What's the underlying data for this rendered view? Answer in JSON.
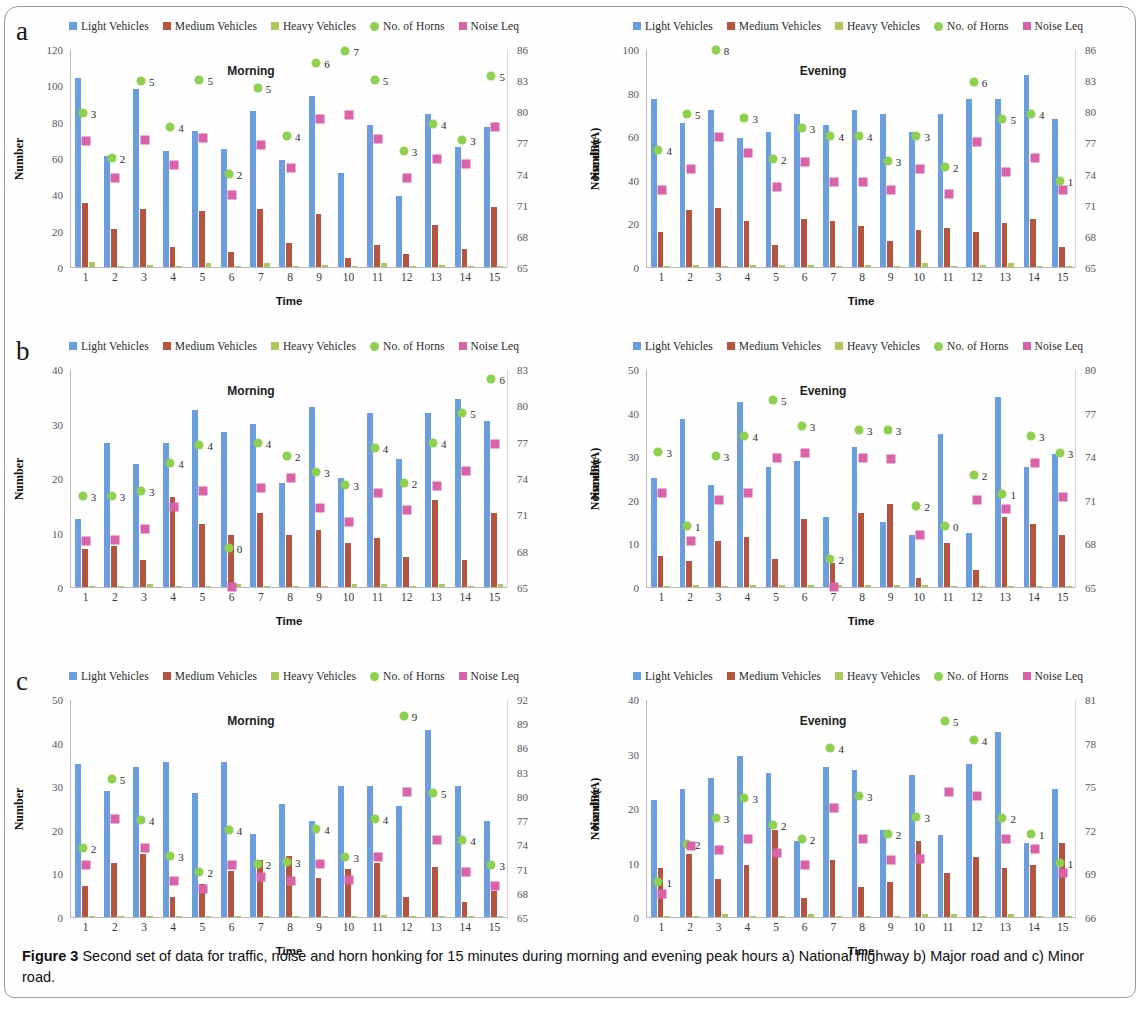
{
  "figure": {
    "caption_label": "Figure 3",
    "caption_text": " Second set of data for traffic, noise and horn honking for 15 minutes during morning and evening peak hours a) National highway b) Major road and c) Minor road."
  },
  "panels": [
    {
      "letter": "a",
      "road": "National highway"
    },
    {
      "letter": "b",
      "road": "Major road"
    },
    {
      "letter": "c",
      "road": "Minor road"
    }
  ],
  "legend": [
    {
      "label": "Light Vehicles",
      "color": "#6a9ede",
      "shape": "square",
      "icon": "light-vehicles-swatch"
    },
    {
      "label": "Medium Vehicles",
      "color": "#b5553f",
      "shape": "square",
      "icon": "medium-vehicles-swatch"
    },
    {
      "label": "Heavy Vehicles",
      "color": "#adc85a",
      "shape": "square",
      "icon": "heavy-vehicles-swatch"
    },
    {
      "label": "No. of Horns",
      "color": "#8fd14f",
      "shape": "dot",
      "icon": "no-of-horns-swatch"
    },
    {
      "label": "Noise Leq",
      "color": "#d963a8",
      "shape": "square",
      "icon": "noise-leq-swatch"
    }
  ],
  "axis_labels": {
    "x": "Time",
    "y_left": "Number",
    "y_right": "Noise dB(A)"
  },
  "colors": {
    "light_vehicles": "#6a9ede",
    "medium_vehicles": "#b5553f",
    "heavy_vehicles": "#adc85a",
    "horns": "#8fd14f",
    "noise": "#d963a8"
  },
  "chart_data": [
    {
      "id": "a-morning",
      "type": "bar",
      "title": "Morning",
      "panel": "a",
      "road": "National highway",
      "xlabel": "Time",
      "ylabel": "Number",
      "y2label": "Noise dB(A)",
      "categories": [
        "1",
        "2",
        "3",
        "4",
        "5",
        "6",
        "7",
        "8",
        "9",
        "10",
        "11",
        "12",
        "13",
        "14",
        "15"
      ],
      "ylim": [
        0,
        120
      ],
      "yticks": [
        0,
        20,
        40,
        60,
        80,
        100,
        120
      ],
      "y2lim": [
        65,
        86
      ],
      "y2ticks": [
        65,
        68,
        71,
        74,
        77,
        80,
        83,
        86
      ],
      "series": [
        {
          "name": "Light Vehicles",
          "values": [
            104,
            61,
            98,
            64,
            75,
            65,
            86,
            59,
            94,
            52,
            78,
            39,
            84,
            66,
            77
          ]
        },
        {
          "name": "Medium Vehicles",
          "values": [
            35,
            21,
            32,
            11,
            31,
            8,
            32,
            13,
            29,
            5,
            12,
            7,
            23,
            10,
            33
          ]
        },
        {
          "name": "Heavy Vehicles",
          "values": [
            3,
            0,
            1,
            0,
            2,
            0,
            2,
            0,
            1,
            0,
            2,
            0,
            1,
            0,
            0
          ]
        }
      ],
      "horns": {
        "name": "No. of Horns",
        "values": [
          3,
          2,
          5,
          4,
          5,
          2,
          5,
          4,
          6,
          7,
          5,
          3,
          4,
          3,
          5
        ],
        "axis": "right",
        "db": [
          79.8,
          75.5,
          82.9,
          78.5,
          83.0,
          74.0,
          82.2,
          77.6,
          84.7,
          85.8,
          83.0,
          76.2,
          78.8,
          77.2,
          83.4
        ]
      },
      "noise": {
        "name": "Noise Leq",
        "axis": "right",
        "values": [
          77.1,
          73.6,
          77.2,
          74.8,
          77.4,
          71.9,
          76.8,
          74.5,
          79.3,
          79.6,
          77.3,
          73.6,
          75.4,
          74.9,
          78.5
        ]
      }
    },
    {
      "id": "a-evening",
      "type": "bar",
      "title": "Evening",
      "panel": "a",
      "road": "National highway",
      "xlabel": "Time",
      "ylabel": "Number",
      "y2label": "Noise dB(A)",
      "categories": [
        "1",
        "2",
        "3",
        "4",
        "5",
        "6",
        "7",
        "8",
        "9",
        "10",
        "11",
        "12",
        "13",
        "14",
        "15"
      ],
      "ylim": [
        0,
        100
      ],
      "yticks": [
        0,
        20,
        40,
        60,
        80,
        100
      ],
      "y2lim": [
        65,
        86
      ],
      "y2ticks": [
        65,
        68,
        71,
        74,
        77,
        80,
        83,
        86
      ],
      "series": [
        {
          "name": "Light Vehicles",
          "values": [
            77,
            66,
            72,
            59,
            62,
            70,
            65,
            72,
            70,
            62,
            70,
            77,
            77,
            88,
            68
          ]
        },
        {
          "name": "Medium Vehicles",
          "values": [
            16,
            26,
            27,
            21,
            10,
            22,
            21,
            19,
            12,
            17,
            18,
            16,
            20,
            22,
            9
          ]
        },
        {
          "name": "Heavy Vehicles",
          "values": [
            0,
            1,
            0,
            1,
            1,
            1,
            0,
            1,
            0,
            2,
            0,
            1,
            2,
            0,
            0
          ]
        }
      ],
      "horns": {
        "name": "No. of Horns",
        "values": [
          4,
          5,
          8,
          3,
          2,
          3,
          4,
          4,
          3,
          3,
          2,
          6,
          5,
          4,
          1
        ],
        "axis": "right",
        "db": [
          76.3,
          79.7,
          85.9,
          79.4,
          75.4,
          78.4,
          77.6,
          77.6,
          75.2,
          77.6,
          74.6,
          82.8,
          79.3,
          79.7,
          73.3
        ]
      },
      "noise": {
        "name": "Noise Leq",
        "axis": "right",
        "values": [
          72.4,
          74.4,
          77.5,
          76.0,
          72.7,
          75.1,
          73.2,
          73.2,
          72.4,
          74.4,
          72.0,
          77.0,
          74.2,
          75.5,
          72.4
        ]
      }
    },
    {
      "id": "b-morning",
      "type": "bar",
      "title": "Morning",
      "panel": "b",
      "road": "Major road",
      "xlabel": "Time",
      "ylabel": "Number",
      "y2label": "Noise dB(A)",
      "categories": [
        "1",
        "2",
        "3",
        "4",
        "5",
        "6",
        "7",
        "8",
        "9",
        "10",
        "11",
        "12",
        "13",
        "14",
        "15"
      ],
      "ylim": [
        0,
        40
      ],
      "yticks": [
        0,
        10,
        20,
        30,
        40
      ],
      "y2lim": [
        65,
        83
      ],
      "y2ticks": [
        65,
        68,
        71,
        74,
        77,
        80,
        83
      ],
      "series": [
        {
          "name": "Light Vehicles",
          "values": [
            12.5,
            26.5,
            22.5,
            26.5,
            32.5,
            28.5,
            30,
            19,
            33,
            20,
            32,
            23.5,
            32,
            34.5,
            30.5
          ]
        },
        {
          "name": "Medium Vehicles",
          "values": [
            7,
            7.5,
            5,
            16.5,
            11.5,
            9.5,
            13.5,
            9.5,
            10.5,
            8,
            9,
            5.5,
            16,
            5,
            13.5
          ]
        },
        {
          "name": "Heavy Vehicles",
          "values": [
            0,
            0,
            0.5,
            0,
            0,
            0.5,
            0,
            0,
            0,
            0.5,
            0.5,
            0,
            0.5,
            0,
            0.5
          ]
        }
      ],
      "horns": {
        "name": "No. of Horns",
        "values": [
          3,
          3,
          3,
          4,
          4,
          0,
          4,
          2,
          3,
          3,
          4,
          2,
          4,
          5,
          6
        ],
        "axis": "right",
        "db": [
          72.5,
          72.5,
          72.9,
          75.2,
          76.7,
          68.2,
          76.9,
          75.8,
          74.5,
          73.4,
          76.5,
          73.6,
          76.9,
          79.4,
          82.2
        ]
      },
      "noise": {
        "name": "Noise Leq",
        "axis": "right",
        "values": [
          68.8,
          68.9,
          69.8,
          71.6,
          72.9,
          65.0,
          73.2,
          74.0,
          71.5,
          70.4,
          72.8,
          71.4,
          73.3,
          74.6,
          76.8
        ]
      }
    },
    {
      "id": "b-evening",
      "type": "bar",
      "title": "Evening",
      "panel": "b",
      "road": "Major road",
      "xlabel": "Time",
      "ylabel": "Number",
      "y2label": "Noise dB(A)",
      "categories": [
        "1",
        "2",
        "3",
        "4",
        "5",
        "6",
        "7",
        "8",
        "9",
        "10",
        "11",
        "12",
        "13",
        "14",
        "15"
      ],
      "ylim": [
        0,
        50
      ],
      "yticks": [
        0,
        10,
        20,
        30,
        40,
        50
      ],
      "y2lim": [
        65,
        80
      ],
      "y2ticks": [
        65,
        68,
        71,
        74,
        77,
        80
      ],
      "series": [
        {
          "name": "Light Vehicles",
          "values": [
            25,
            38.5,
            23.5,
            42.5,
            27.5,
            29,
            16,
            32,
            15,
            12,
            35,
            12.5,
            43.5,
            27.5,
            30.5
          ]
        },
        {
          "name": "Medium Vehicles",
          "values": [
            7,
            6,
            10.5,
            11.5,
            6.5,
            15.5,
            5.5,
            17,
            19,
            2,
            10,
            4,
            16,
            14.5,
            12
          ]
        },
        {
          "name": "Heavy Vehicles",
          "values": [
            0,
            0.5,
            0,
            0.5,
            0.5,
            0.5,
            0.5,
            0.5,
            0.5,
            0.5,
            0,
            0,
            0,
            0,
            0
          ]
        }
      ],
      "horns": {
        "name": "No. of Horns",
        "values": [
          3,
          1,
          3,
          4,
          5,
          3,
          2,
          3,
          3,
          2,
          0,
          2,
          1,
          3,
          3
        ],
        "axis": "right",
        "db": [
          74.3,
          69.2,
          74.0,
          75.4,
          77.9,
          76.1,
          66.9,
          75.8,
          75.8,
          70.6,
          69.2,
          72.7,
          71.4,
          75.4,
          74.2
        ]
      },
      "noise": {
        "name": "Noise Leq",
        "axis": "right",
        "values": [
          71.5,
          68.2,
          71.0,
          71.5,
          73.9,
          74.2,
          65.0,
          73.9,
          73.8,
          68.6,
          null,
          71.0,
          70.4,
          73.5,
          71.2
        ]
      }
    },
    {
      "id": "c-morning",
      "type": "bar",
      "title": "Morning",
      "panel": "c",
      "road": "Minor road",
      "xlabel": "Time",
      "ylabel": "Number",
      "y2label": "Noise dB(A)",
      "categories": [
        "1",
        "2",
        "3",
        "4",
        "5",
        "6",
        "7",
        "8",
        "9",
        "10",
        "11",
        "12",
        "13",
        "14",
        "15"
      ],
      "ylim": [
        0,
        50
      ],
      "yticks": [
        0,
        10,
        20,
        30,
        40,
        50
      ],
      "y2lim": [
        65,
        92
      ],
      "y2ticks": [
        65,
        68,
        71,
        74,
        77,
        80,
        83,
        86,
        89,
        92
      ],
      "series": [
        {
          "name": "Light Vehicles",
          "values": [
            35,
            29,
            34.5,
            35.5,
            28.5,
            35.5,
            19,
            26,
            22,
            30,
            30,
            25.5,
            43,
            30,
            22
          ]
        },
        {
          "name": "Medium Vehicles",
          "values": [
            7,
            12.5,
            14.5,
            4.5,
            7.5,
            10.5,
            13,
            14,
            9,
            11,
            12.5,
            4.5,
            11.5,
            3.5,
            6
          ]
        },
        {
          "name": "Heavy Vehicles",
          "values": [
            0,
            0,
            0,
            0,
            0,
            0,
            0,
            0,
            0,
            0,
            0.5,
            0,
            0,
            0,
            0
          ]
        }
      ],
      "horns": {
        "name": "No. of Horns",
        "values": [
          2,
          5,
          4,
          3,
          2,
          4,
          2,
          3,
          4,
          3,
          4,
          9,
          5,
          4,
          3
        ],
        "axis": "right",
        "db": [
          73.5,
          82.1,
          77.0,
          72.5,
          70.6,
          75.8,
          71.6,
          71.8,
          75.9,
          72.4,
          77.2,
          89.9,
          80.3,
          74.5,
          71.5
        ]
      },
      "noise": {
        "name": "Noise Leq",
        "axis": "right",
        "values": [
          71.5,
          77.2,
          73.6,
          69.5,
          68.5,
          71.5,
          70.0,
          69.5,
          71.6,
          69.6,
          72.4,
          80.5,
          74.5,
          70.6,
          68.8
        ]
      }
    },
    {
      "id": "c-evening",
      "type": "bar",
      "title": "Evening",
      "panel": "c",
      "road": "Minor road",
      "xlabel": "Time",
      "ylabel": "Number",
      "y2label": "Noise dB(A)",
      "categories": [
        "1",
        "2",
        "3",
        "4",
        "5",
        "6",
        "7",
        "8",
        "9",
        "10",
        "11",
        "12",
        "13",
        "14",
        "15"
      ],
      "ylim": [
        0,
        40
      ],
      "yticks": [
        0,
        10,
        20,
        30,
        40
      ],
      "y2lim": [
        66,
        81
      ],
      "y2ticks": [
        66,
        69,
        72,
        75,
        78,
        81
      ],
      "series": [
        {
          "name": "Light Vehicles",
          "values": [
            21.5,
            23.5,
            25.5,
            29.5,
            26.5,
            14,
            27.5,
            27,
            16,
            26,
            15,
            28,
            34,
            13.5,
            23.5
          ]
        },
        {
          "name": "Medium Vehicles",
          "values": [
            9,
            11.5,
            7,
            9.5,
            16,
            3.5,
            10.5,
            5.5,
            6.5,
            14,
            8,
            11,
            9,
            9.5,
            13.5
          ]
        },
        {
          "name": "Heavy Vehicles",
          "values": [
            0,
            0,
            0.5,
            0,
            0,
            0.5,
            0,
            0,
            0,
            0.5,
            0.5,
            0,
            0.5,
            0,
            0
          ]
        }
      ],
      "horns": {
        "name": "No. of Horns",
        "values": [
          1,
          2,
          3,
          3,
          2,
          2,
          4,
          3,
          2,
          3,
          5,
          4,
          2,
          1,
          1
        ],
        "axis": "right",
        "db": [
          68.4,
          71.0,
          72.8,
          74.2,
          72.3,
          71.4,
          77.6,
          74.3,
          71.7,
          72.9,
          79.5,
          78.2,
          72.8,
          71.7,
          69.7
        ]
      },
      "noise": {
        "name": "Noise Leq",
        "axis": "right",
        "values": [
          67.6,
          70.9,
          70.6,
          71.4,
          70.4,
          69.6,
          73.5,
          71.4,
          69.9,
          70.0,
          74.6,
          74.3,
          71.4,
          70.7,
          69.0
        ]
      }
    }
  ]
}
